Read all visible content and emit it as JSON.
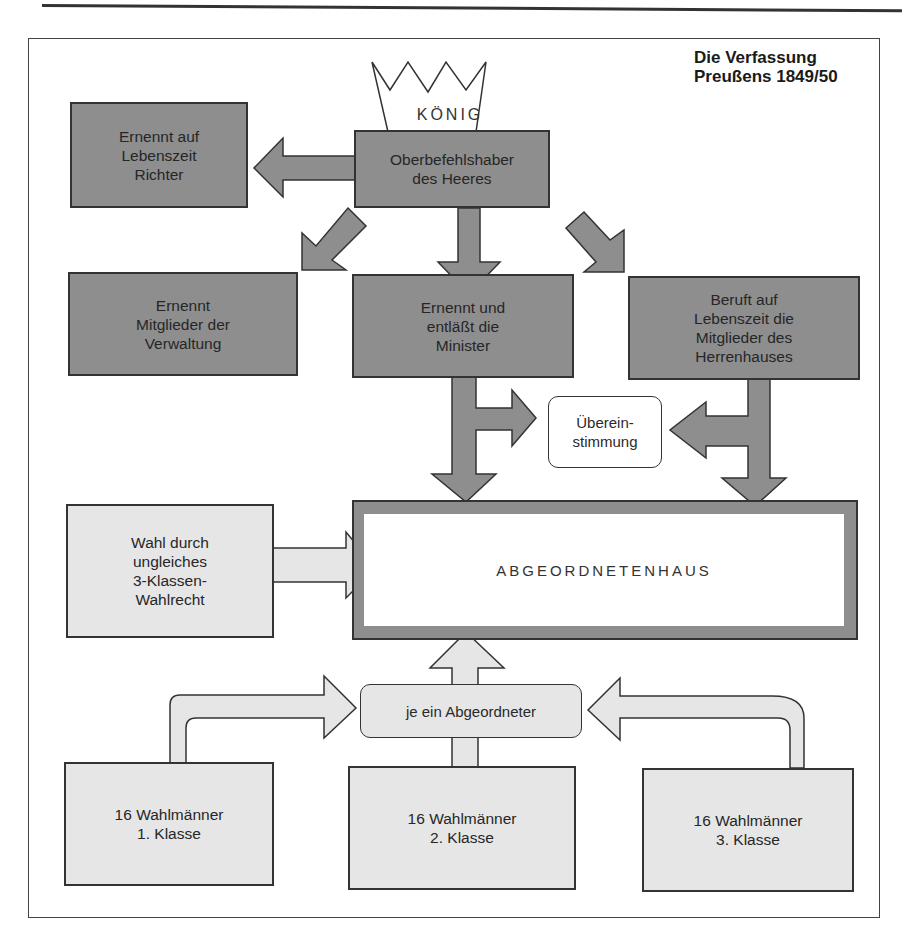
{
  "title": "Die Verfassung\nPreußens 1849/50",
  "crown": {
    "label": "KÖNIG",
    "icon": "crown-icon"
  },
  "king_powers": {
    "commander": "Oberbefehlshaber\ndes Heeres",
    "judges": "Ernennt auf\nLebenszeit\nRichter",
    "administration": "Ernennt\nMitglieder der\nVerwaltung",
    "ministers": "Ernennt und\nentläßt die\nMinister",
    "herrenhaus": "Beruft auf\nLebenszeit die\nMitglieder des\nHerrenhauses"
  },
  "agreement": "Überein-\nstimmung",
  "parliament": {
    "label": "ABGEORDNETENHAUS"
  },
  "election": "Wahl durch\nungleiches\n3-Klassen-\nWahlrecht",
  "delegate": "je ein Abgeordneter",
  "electors": [
    {
      "label": "16 Wahlmänner\n1. Klasse"
    },
    {
      "label": "16 Wahlmänner\n2. Klasse"
    },
    {
      "label": "16 Wahlmänner\n3. Klasse"
    }
  ],
  "colors": {
    "dark_box": "#8e8e8e",
    "light_box": "#e6e6e6",
    "outline": "#333333",
    "background": "#ffffff"
  }
}
